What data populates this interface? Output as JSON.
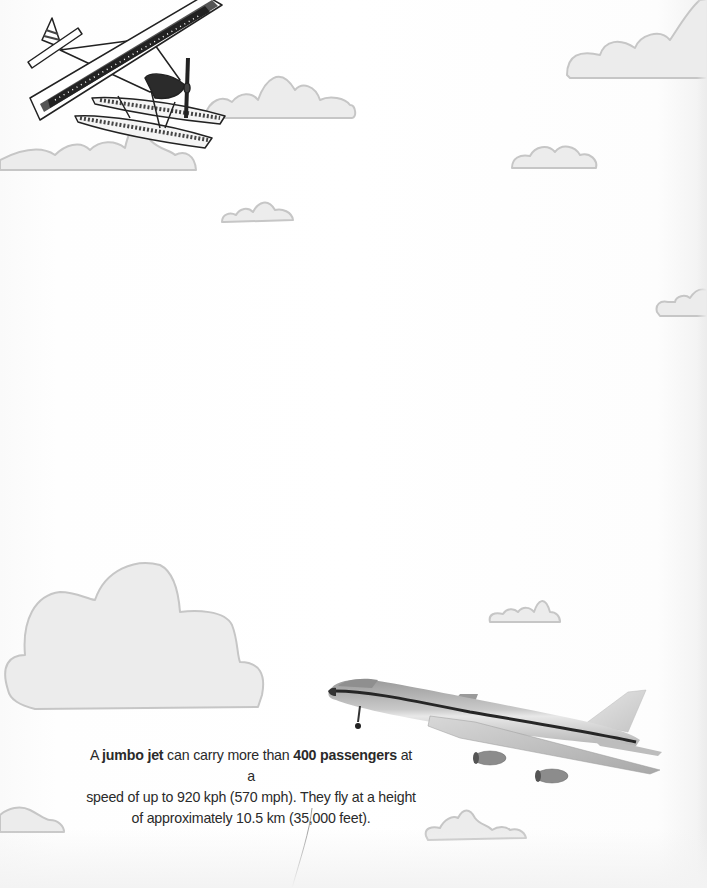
{
  "page": {
    "background_color": "#ffffff",
    "cloud_fill": "#ececec",
    "cloud_stroke": "#c9c9c9"
  },
  "illustrations": {
    "seaplane": {
      "label": "seaplane-illustration",
      "position": "top-left"
    },
    "jumbo_jet": {
      "label": "jumbo-jet-photo",
      "position": "bottom-right"
    }
  },
  "caption": {
    "line1_pre": "A ",
    "line1_bold1": "jumbo jet",
    "line1_mid": " can carry more than ",
    "line1_bold2": "400 passengers",
    "line1_post": " at a",
    "line2": "speed of up to 920 kph (570 mph). They fly at a height",
    "line3": "of approximately 10.5 km (35,000 feet)."
  }
}
